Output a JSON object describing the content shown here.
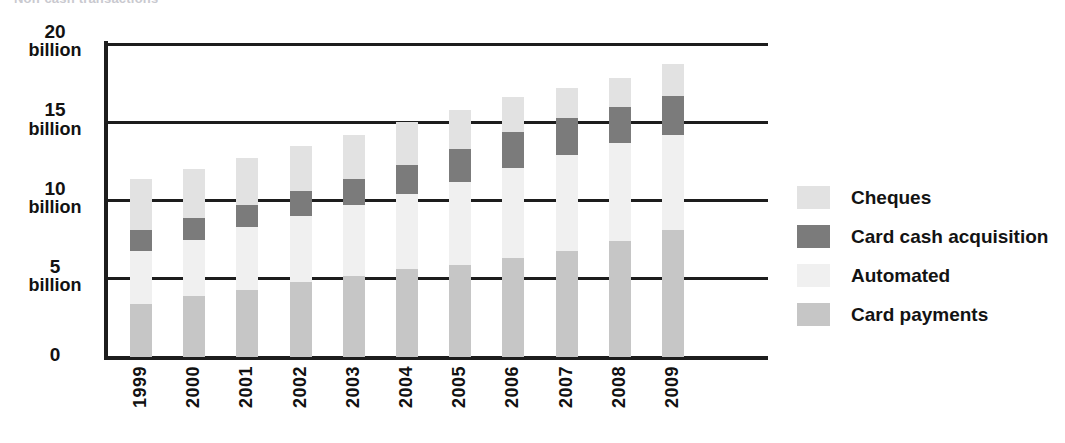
{
  "caption_fragment": "Non-cash transactions",
  "chart_data": {
    "type": "bar",
    "subtype": "stacked-vertical",
    "title": "",
    "xlabel": "",
    "ylabel": "",
    "ylim": [
      0,
      20
    ],
    "yticks": [
      0,
      5,
      10,
      15,
      20
    ],
    "ytick_labels": [
      {
        "num": "0",
        "unit": ""
      },
      {
        "num": "5",
        "unit": "billion"
      },
      {
        "num": "10",
        "unit": "billion"
      },
      {
        "num": "15",
        "unit": "billion"
      },
      {
        "num": "20",
        "unit": "billion"
      }
    ],
    "grid": true,
    "grid_axis": "y",
    "legend_position": "right",
    "categories": [
      "1999",
      "2000",
      "2001",
      "2002",
      "2003",
      "2004",
      "2005",
      "2006",
      "2007",
      "2008",
      "2009"
    ],
    "stack_order_bottom_to_top": [
      "Card payments",
      "Automated",
      "Card cash acquisition",
      "Cheques"
    ],
    "series": [
      {
        "name": "Card payments",
        "color": "#c6c6c6",
        "values": [
          3.4,
          3.9,
          4.3,
          4.8,
          5.2,
          5.6,
          5.9,
          6.3,
          6.8,
          7.4,
          8.1
        ]
      },
      {
        "name": "Automated",
        "color": "#f0f0f0",
        "values": [
          3.4,
          3.6,
          4.0,
          4.2,
          4.5,
          4.8,
          5.3,
          5.8,
          6.1,
          6.3,
          6.1
        ]
      },
      {
        "name": "Card cash acquisition",
        "color": "#7b7b7b",
        "values": [
          1.3,
          1.4,
          1.4,
          1.6,
          1.7,
          1.9,
          2.1,
          2.3,
          2.4,
          2.3,
          2.5
        ]
      },
      {
        "name": "Cheques",
        "color": "#e2e2e2",
        "values": [
          3.3,
          3.1,
          3.0,
          2.9,
          2.8,
          2.7,
          2.5,
          2.2,
          1.9,
          1.8,
          2.0
        ]
      }
    ],
    "totals": [
      11.4,
      12.0,
      12.7,
      13.5,
      14.2,
      15.0,
      15.8,
      16.6,
      17.2,
      17.8,
      18.7
    ],
    "legend": [
      {
        "label": "Cheques",
        "color": "#e2e2e2"
      },
      {
        "label": "Card cash acquisition",
        "color": "#7b7b7b"
      },
      {
        "label": "Automated",
        "color": "#f0f0f0"
      },
      {
        "label": "Card payments",
        "color": "#c6c6c6"
      }
    ]
  }
}
